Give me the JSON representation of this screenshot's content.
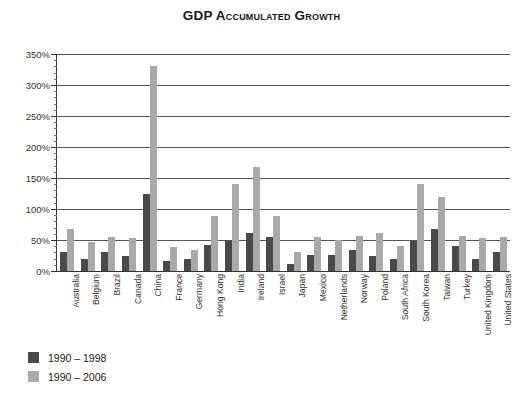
{
  "chart_data": {
    "type": "bar",
    "title": "GDP Accumulated Growth",
    "xlabel": "",
    "ylabel": "",
    "ylim": [
      0,
      350
    ],
    "ytick_values": [
      0,
      50,
      100,
      150,
      200,
      250,
      300,
      350
    ],
    "ytick_labels": [
      "0%",
      "50%",
      "100%",
      "150%",
      "200%",
      "250%",
      "300%",
      "350%"
    ],
    "minor_tick_step": 10,
    "grid": true,
    "grid_axis": "y",
    "legend_position": "below-left",
    "categories": [
      "Australia",
      "Belgium",
      "Brazil",
      "Canada",
      "China",
      "France",
      "Germany",
      "Hong Kong",
      "India",
      "Ireland",
      "Israel",
      "Japan",
      "Mexico",
      "Netherlands",
      "Norway",
      "Poland",
      "South Africa",
      "South Korea",
      "Taiwan",
      "Turkey",
      "United Kingdom",
      "United States"
    ],
    "series": [
      {
        "name": "1990 – 1998",
        "color": "#4a4a4a",
        "values": [
          31,
          20,
          30,
          24,
          125,
          16,
          20,
          42,
          48,
          62,
          55,
          12,
          26,
          26,
          34,
          24,
          19,
          48,
          68,
          40,
          20,
          30
        ]
      },
      {
        "name": "1990 – 2006",
        "color": "#a9a9a9",
        "values": [
          67,
          46,
          55,
          54,
          330,
          38,
          34,
          88,
          140,
          168,
          88,
          30,
          55,
          50,
          56,
          62,
          40,
          140,
          120,
          56,
          54,
          55
        ]
      }
    ]
  },
  "legend": {
    "items": [
      {
        "label": "1990 – 1998",
        "swatch": "dark"
      },
      {
        "label": "1990 – 2006",
        "swatch": "light"
      }
    ]
  },
  "colors": {
    "series_dark": "#4a4a4a",
    "series_light": "#a9a9a9",
    "grid": "#555555",
    "axis": "#333333",
    "text": "#222222",
    "background": "#ffffff"
  }
}
